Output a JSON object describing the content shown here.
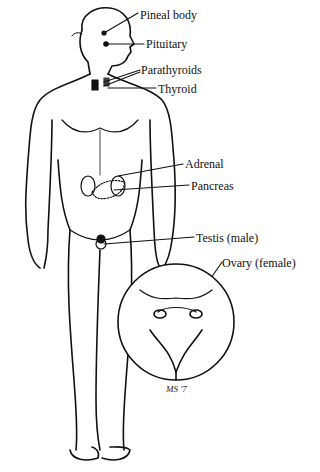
{
  "diagram": {
    "colors": {
      "ink": "#111111",
      "background": "#ffffff"
    },
    "labels": [
      {
        "id": "pineal",
        "text": "Pineal body",
        "x": 140,
        "y": 16
      },
      {
        "id": "pituitary",
        "text": "Pituitary",
        "x": 146,
        "y": 40
      },
      {
        "id": "parathyroids",
        "text": "Parathyroids",
        "x": 141,
        "y": 65
      },
      {
        "id": "thyroid",
        "text": "Thyroid",
        "x": 158,
        "y": 84
      },
      {
        "id": "adrenal",
        "text": "Adrenal",
        "x": 185,
        "y": 160
      },
      {
        "id": "pancreas",
        "text": "Pancreas",
        "x": 191,
        "y": 181
      },
      {
        "id": "testis",
        "text": "Testis (male)",
        "x": 196,
        "y": 233
      },
      {
        "id": "ovary",
        "text": "Ovary (female)",
        "x": 222,
        "y": 256
      }
    ],
    "inset": {
      "description": "Female pelvic region inset circle"
    },
    "signature": "MS '7"
  }
}
